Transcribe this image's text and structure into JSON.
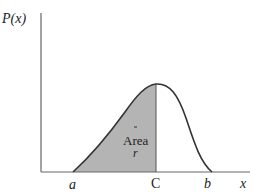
{
  "figure": {
    "y_axis_label": "P(x)",
    "x_axis_label": "x",
    "tick_labels": {
      "a": "a",
      "c": "C",
      "b": "b"
    },
    "area_label_line1": "Area",
    "area_label_line2": "r",
    "colors": {
      "shade": "#b4b4b4",
      "curve": "#333333",
      "axis": "#666666",
      "background": "#ffffff"
    }
  }
}
